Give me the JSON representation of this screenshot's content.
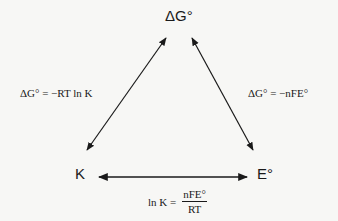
{
  "nodes": {
    "top": "ΔG°",
    "left": "K",
    "right": "E°"
  },
  "equations": {
    "left": "ΔG° =  −RT ln K",
    "right": "ΔG° =  −nFE°",
    "bottom": {
      "lhs": "ln K  =",
      "numerator": "nFE°",
      "denominator": "RT"
    }
  },
  "arrows": [
    {
      "from": "K",
      "to": "ΔG°",
      "bidirectional": true
    },
    {
      "from": "ΔG°",
      "to": "E°",
      "bidirectional": true
    },
    {
      "from": "K",
      "to": "E°",
      "bidirectional": true
    }
  ],
  "colors": {
    "background": "#f7f7f5",
    "ink": "#1a1a1a"
  }
}
